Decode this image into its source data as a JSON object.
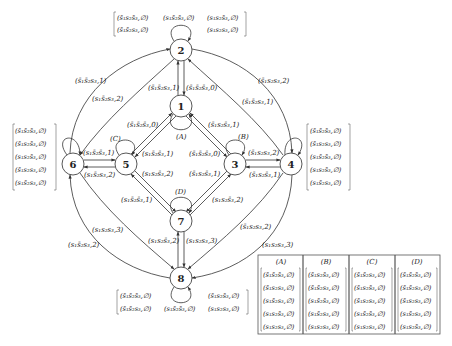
{
  "nodes": [
    {
      "id": "1",
      "x": 181,
      "y": 106
    },
    {
      "id": "2",
      "x": 181,
      "y": 50
    },
    {
      "id": "3",
      "x": 235,
      "y": 164
    },
    {
      "id": "4",
      "x": 291,
      "y": 164
    },
    {
      "id": "5",
      "x": 126,
      "y": 164
    },
    {
      "id": "6",
      "x": 73,
      "y": 164
    },
    {
      "id": "7",
      "x": 181,
      "y": 221
    },
    {
      "id": "8",
      "x": 181,
      "y": 278
    }
  ],
  "loop_labels": {
    "A": "(A)",
    "B": "(B)",
    "C": "(C)",
    "D": "(D)"
  },
  "edge_labels": {
    "e_1_2": "(s̄₁s̄₂s₃,1)",
    "e_2_1": "(s̄₁s̄₂s̄₃,0)",
    "e_6_2_outer": "(s̄₁s̄₂s₃,1)",
    "e_2_6_inner": "(s₁s̄₂s₃,2)",
    "e_4_2_outer": "(s̄₁s₂s₃,2)",
    "e_2_4_inner": "(s̄₁s̄₂s₃,1)",
    "e_5_1": "(s̄₁s̄₂s̄₃,0)",
    "e_1_3": "(s̄₁s₂s̄₃,1)",
    "e_1_5": "(s₁s̄₂s̄₃,1)",
    "e_3_1": "(s̄₁s̄₂s̄₃,0)",
    "e_6_5": "(s₁s̄₂s̄₃,1)",
    "e_5_6": "(s₁s̄₂s₃,2)",
    "e_3_4": "(s̄₁s₂s₃,2)",
    "e_4_3": "(s̄₁s₂s̄₃,1)",
    "e_5_7": "(s₁s₂s̄₃,2)",
    "e_7_3": "(s̄₁s₂s̄₃,1)",
    "e_7_5": "(s₁s̄₂s̄₃,1)",
    "e_3_7": "(s₁s₂s̄₃,2)",
    "e_6_8_inner": "(s₁s₂s₃,3)",
    "e_8_6_outer": "(s₁s̄₂s₃,2)",
    "e_4_8_inner": "(s̄₁s₂s₃,2)",
    "e_8_4_outer": "(s₁s₂s₃,3)",
    "e_8_7": "(s₁s₂s̄₃,2)",
    "e_7_8": "(s₁s₂s₃,3)"
  },
  "self_loop_sets": {
    "node2": {
      "row1": [
        "(s̄₁s₂s̄₃,∅)",
        "(s₁s̄₂s̄₃,∅)",
        "(s₁s₂s̄₃,∅)"
      ],
      "row2": [
        "(s̄₁s̄₂s₃,∅)",
        "",
        "(s₁s₂s₃,∅)"
      ]
    },
    "node6": [
      "(s̄₁s̄₂s̄₃,∅)",
      "(s̄₁s₂s̄₃,∅)",
      "(s₁s₂s̄₃,∅)",
      "(s̄₁s₂s₃,∅)",
      "(s₁s̄₂s₃,∅)"
    ],
    "node4": [
      "(s̄₁s̄₂s̄₃,∅)",
      "(s̄₁s₂s₃,∅)",
      "(s₁s̄₂s̄₃,∅)",
      "(s₁s₂s̄₃,∅)",
      "(s₁s̄₂s₃,∅)"
    ],
    "node8": {
      "row1": [
        "(s̄₁s̄₂s̄₃,∅)",
        "",
        "(s̄₁s₂s̄₃,∅)"
      ],
      "row2": [
        "(s̄₁s̄₂s₃,∅)",
        "(s₁s̄₂s̄₃,∅)",
        "(s₁s₂s₃,∅)"
      ]
    }
  },
  "legend_table": {
    "columns": [
      {
        "header": "(A)",
        "rows": [
          "(s̄₁s̄₂s̄₃,∅)",
          "(s̄₁s₂s₃,∅)",
          "(s₁s̄₂s₃,∅)",
          "(s₁s₂s̄₃,∅)",
          "(s₁s₂s₃,∅)"
        ]
      },
      {
        "header": "(B)",
        "rows": [
          "(s̄₁s₂s̄₃,∅)",
          "(s̄₁s̄₂s₃,∅)",
          "(s₁s̄₂s̄₃,∅)",
          "(s₁s̄₂s₃,∅)",
          "(s₁s₂s₃,∅)"
        ]
      },
      {
        "header": "(C)",
        "rows": [
          "(s̄₁s̄₂s₃,∅)",
          "(s̄₁s₂s̄₃,∅)",
          "(s̄₁s₂s₃,∅)",
          "(s₁s̄₂s̄₃,∅)",
          "(s₁s₂s₃,∅)"
        ]
      },
      {
        "header": "(D)",
        "rows": [
          "(s̄₁s̄₂s̄₃,∅)",
          "(s̄₁s̄₂s₃,∅)",
          "(s̄₁s₂s₃,∅)",
          "(s₁s̄₂s₃,∅)",
          "(s₁s₂s̄₃,∅)"
        ]
      }
    ]
  }
}
